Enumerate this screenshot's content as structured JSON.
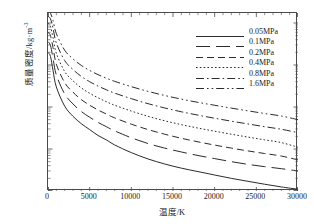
{
  "figure": {
    "axis_color": "#4a4a4a",
    "line_color": "#2b2b2b"
  },
  "axes": {
    "x_title": "温度/K",
    "y_title": "质量密度/kg·m",
    "y_title_exp": "-3",
    "x_ticks": [
      "0",
      "5000",
      "10000",
      "15000",
      "20000",
      "25000",
      "30000"
    ],
    "y_ticks": [
      {
        "mantissa": "10",
        "exp": "1"
      },
      {
        "mantissa": "10",
        "exp": "0"
      },
      {
        "mantissa": "10",
        "exp": "-1"
      },
      {
        "mantissa": "10",
        "exp": "-2"
      },
      {
        "mantissa": "10",
        "exp": "-3"
      }
    ]
  },
  "legend": {
    "items": [
      {
        "label": "0.05MPa",
        "dash": "none"
      },
      {
        "label": "0.1MPa",
        "dash": "14,6"
      },
      {
        "label": "0.2MPa",
        "dash": "7,4"
      },
      {
        "label": "0.4MPa",
        "dash": "1.6,2.2"
      },
      {
        "label": "0.8MPa",
        "dash": "8,3,1.6,3"
      },
      {
        "label": "1.6MPa",
        "dash": "8,3,1.6,3,1.6,3"
      }
    ]
  },
  "chart_data": {
    "type": "line",
    "title": "",
    "xlabel": "温度/K",
    "ylabel": "质量密度/kg·m^-3",
    "xlim": [
      0,
      30000
    ],
    "ylim": [
      0.001,
      20
    ],
    "yscale": "log",
    "grid": false,
    "legend_position": "top-right",
    "x": [
      0,
      300,
      600,
      1000,
      2000,
      3000,
      4000,
      5000,
      6000,
      7000,
      8000,
      10000,
      12000,
      14000,
      16000,
      18000,
      20000,
      22000,
      24000,
      26000,
      28000,
      30000
    ],
    "series": [
      {
        "name": "0.05MPa",
        "dash": "none",
        "values": [
          2.0,
          1.6,
          0.75,
          0.3,
          0.105,
          0.06,
          0.04,
          0.029,
          0.021,
          0.0165,
          0.0125,
          0.0082,
          0.0058,
          0.0044,
          0.0035,
          0.0029,
          0.0024,
          0.002,
          0.0017,
          0.00145,
          0.00125,
          0.0011
        ]
      },
      {
        "name": "0.1MPa",
        "dash": "14,6",
        "values": [
          3.6,
          2.9,
          1.45,
          0.58,
          0.205,
          0.118,
          0.078,
          0.057,
          0.043,
          0.034,
          0.027,
          0.0185,
          0.0135,
          0.0105,
          0.0085,
          0.007,
          0.0059,
          0.005,
          0.0043,
          0.0038,
          0.0034,
          0.003
        ]
      },
      {
        "name": "0.2MPa",
        "dash": "7,4",
        "values": [
          6.0,
          5.0,
          2.6,
          1.05,
          0.38,
          0.225,
          0.15,
          0.11,
          0.085,
          0.068,
          0.055,
          0.039,
          0.029,
          0.0225,
          0.018,
          0.0148,
          0.0124,
          0.0105,
          0.009,
          0.0078,
          0.0068,
          0.0055
        ]
      },
      {
        "name": "0.4MPa",
        "dash": "1.6,2.2",
        "values": [
          10.0,
          8.2,
          4.5,
          1.9,
          0.7,
          0.42,
          0.285,
          0.212,
          0.166,
          0.134,
          0.11,
          0.08,
          0.06,
          0.047,
          0.038,
          0.0315,
          0.0265,
          0.0225,
          0.0192,
          0.0165,
          0.0142,
          0.011
        ]
      },
      {
        "name": "0.8MPa",
        "dash": "8,3,1.6,3",
        "values": [
          14.5,
          12.5,
          7.6,
          3.35,
          1.28,
          0.78,
          0.535,
          0.4,
          0.315,
          0.257,
          0.214,
          0.158,
          0.12,
          0.095,
          0.077,
          0.064,
          0.054,
          0.046,
          0.0395,
          0.034,
          0.0295,
          0.0245
        ]
      },
      {
        "name": "1.6MPa",
        "dash": "8,3,1.6,3,1.6,3",
        "values": [
          20.0,
          17.0,
          11.5,
          5.6,
          2.25,
          1.4,
          0.975,
          0.74,
          0.59,
          0.485,
          0.408,
          0.305,
          0.236,
          0.188,
          0.154,
          0.129,
          0.11,
          0.094,
          0.081,
          0.07,
          0.061,
          0.05
        ]
      }
    ]
  }
}
